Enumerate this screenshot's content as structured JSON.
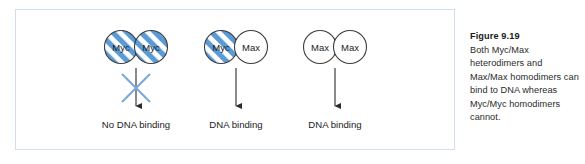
{
  "figure": {
    "panel": {
      "border_color": "#cfe0ec",
      "background": "#ffffff"
    },
    "colors": {
      "stripe_blue": "#5b9bd5",
      "stripe_white": "#ffffff",
      "circle_outline": "#3c3c3c",
      "arrow": "#2b2b2b",
      "cross": "#7fa9d4",
      "text": "#1b1b1b"
    },
    "groups": [
      {
        "id": "myc-myc",
        "left_node": {
          "label": "Myc",
          "fill": "striped-blue"
        },
        "right_node": {
          "label": "Myc",
          "fill": "striped-blue"
        },
        "marker": "cross-out",
        "outcome": "No DNA binding"
      },
      {
        "id": "myc-max",
        "left_node": {
          "label": "Myc",
          "fill": "striped-blue"
        },
        "right_node": {
          "label": "Max",
          "fill": "white"
        },
        "marker": "arrow",
        "outcome": "DNA binding"
      },
      {
        "id": "max-max",
        "left_node": {
          "label": "Max",
          "fill": "white"
        },
        "right_node": {
          "label": "Max",
          "fill": "white"
        },
        "marker": "arrow",
        "outcome": "DNA binding"
      }
    ]
  },
  "caption": {
    "title": "Figure 9.19",
    "body": "Both Myc/Max heterodimers and Max/Max homodimers can bind to DNA whereas Myc/Myc homodimers cannot."
  }
}
